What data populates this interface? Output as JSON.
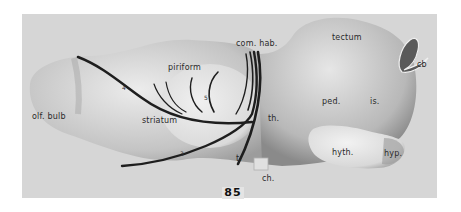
{
  "figure": {
    "number": "85"
  },
  "labels": {
    "olf_bulb": "olf. bulb",
    "piriform": "piriform",
    "striatum": "striatum",
    "com_hab": "com. hab.",
    "tectum": "tectum",
    "cb": "cb",
    "ped": "ped.",
    "is": "is.",
    "th": "th.",
    "hyth": "hyth.",
    "hyp": "hyp.",
    "ch": "ch.",
    "t": "t."
  },
  "tract_numbers": {
    "n4": "4",
    "n5": "5",
    "n3": "3"
  },
  "colors": {
    "background": "#d6d6d6",
    "model_light": "#e8e8e8",
    "model_shadow": "#9a9a9a",
    "tract": "#1e1e1e"
  }
}
